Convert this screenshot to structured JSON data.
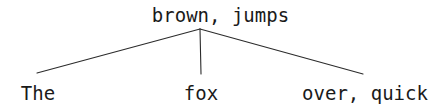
{
  "figure": {
    "kind": "syntax-tree-diagram",
    "width": 441,
    "height": 109,
    "background_color": "#ffffff",
    "stroke_color": "#2b2b2b",
    "text_color": "#1a1a1a"
  },
  "tree": {
    "root": {
      "label": "brown, jumps",
      "x": 200,
      "y": 29
    },
    "leaves": [
      {
        "label": "The",
        "x": 37,
        "y": 73
      },
      {
        "label": "fox",
        "x": 201,
        "y": 74
      },
      {
        "label": "over, quick",
        "x": 363,
        "y": 74
      }
    ],
    "edges": [
      {
        "from": "root",
        "to": "The",
        "x1": 200,
        "y1": 29,
        "x2": 37,
        "y2": 73
      },
      {
        "from": "root",
        "to": "fox",
        "x1": 200,
        "y1": 29,
        "x2": 201,
        "y2": 74
      },
      {
        "from": "root",
        "to": "over, quick",
        "x1": 200,
        "y1": 29,
        "x2": 363,
        "y2": 74
      }
    ]
  }
}
